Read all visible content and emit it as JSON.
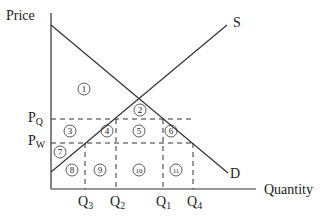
{
  "axes": {
    "y_label": "Price",
    "x_label": "Quantity"
  },
  "curves": {
    "supply_label": "S",
    "demand_label": "D"
  },
  "price_levels": [
    {
      "label": "P",
      "sub": "Q"
    },
    {
      "label": "P",
      "sub": "W"
    }
  ],
  "quantity_levels": [
    {
      "label": "Q",
      "sub": "3"
    },
    {
      "label": "Q",
      "sub": "2"
    },
    {
      "label": "Q",
      "sub": "1"
    },
    {
      "label": "Q",
      "sub": "4"
    }
  ],
  "regions": [
    "1",
    "2",
    "3",
    "4",
    "5",
    "6",
    "7",
    "8",
    "9",
    "10",
    "11"
  ],
  "colors": {
    "line": "#333333",
    "text": "#222222"
  }
}
